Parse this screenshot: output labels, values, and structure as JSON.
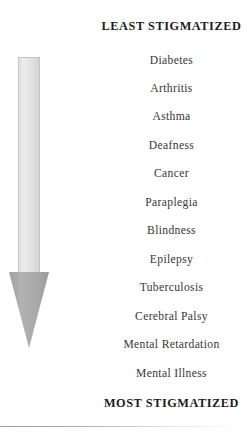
{
  "figure": {
    "title_top": "LEAST STIGMATIZED",
    "title_bottom": "MOST STIGMATIZED",
    "arrow": {
      "direction": "down",
      "shaft_color": "#e3e3e3",
      "shaft_border_color": "#c4c4c4",
      "head_color": "#a8a8a8"
    },
    "items": [
      {
        "label": "Diabetes",
        "top": 54
      },
      {
        "label": "Arthritis",
        "top": 82
      },
      {
        "label": "Asthma",
        "top": 110
      },
      {
        "label": "Deafness",
        "top": 139
      },
      {
        "label": "Cancer",
        "top": 167
      },
      {
        "label": "Paraplegia",
        "top": 196
      },
      {
        "label": "Blindness",
        "top": 224
      },
      {
        "label": "Epilepsy",
        "top": 253
      },
      {
        "label": "Tuberculosis",
        "top": 281
      },
      {
        "label": "Cerebral Palsy",
        "top": 310
      },
      {
        "label": "Mental Retardation",
        "top": 338
      },
      {
        "label": "Mental Illness",
        "top": 367
      }
    ]
  }
}
